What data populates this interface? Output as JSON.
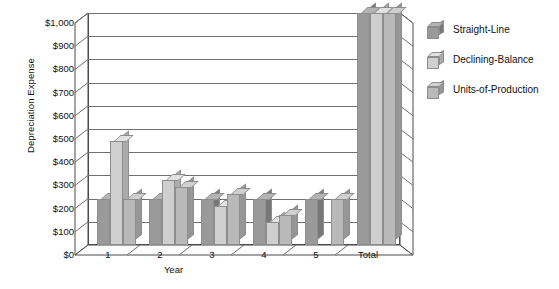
{
  "chart_data": {
    "type": "bar",
    "title": "",
    "xlabel": "Year",
    "ylabel": "Depreciation Expense",
    "categories": [
      "1",
      "2",
      "3",
      "4",
      "5",
      "Total"
    ],
    "ylim": [
      0,
      1000
    ],
    "ytick_values": [
      0,
      100,
      200,
      300,
      400,
      500,
      600,
      700,
      800,
      900,
      1000
    ],
    "ytick_labels": [
      "$0",
      "$100",
      "$200",
      "$300",
      "$400",
      "$500",
      "$600",
      "$700",
      "$800",
      "$900",
      "$1,000"
    ],
    "grid": true,
    "legend_position": "right",
    "three_d": true,
    "series": [
      {
        "name": "Straight-Line",
        "color": "#9a9a9a",
        "side_color": "#787878",
        "top_color": "#b4b4b4",
        "values": [
          200,
          200,
          200,
          200,
          200,
          1000
        ]
      },
      {
        "name": "Declining-Balance",
        "color": "#cfcfcf",
        "side_color": "#ababab",
        "top_color": "#e2e2e2",
        "values": [
          450,
          280,
          170,
          100,
          0,
          1000
        ]
      },
      {
        "name": "Units-of-Production",
        "color": "#b9b9b9",
        "side_color": "#969696",
        "top_color": "#d0d0d0",
        "values": [
          200,
          250,
          220,
          130,
          200,
          1000
        ]
      }
    ]
  },
  "axes": {
    "y_title": "Depreciation Expense",
    "x_title": "Year"
  }
}
